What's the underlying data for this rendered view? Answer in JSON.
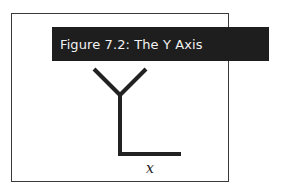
{
  "figure": {
    "title": "Figure 7.2: The Y Axis",
    "axis_label": "x"
  },
  "colors": {
    "banner_bg": "#1e1e1e",
    "banner_text": "#f2f2f2",
    "stroke": "#222222",
    "frame": "#3a3a3a"
  }
}
